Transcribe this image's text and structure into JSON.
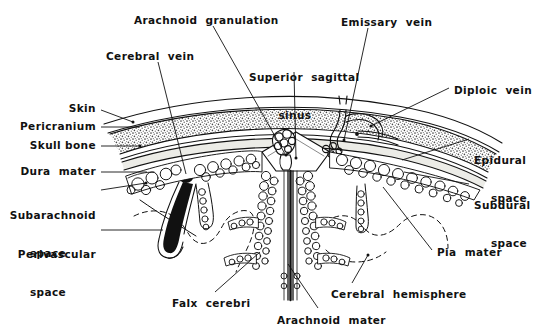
{
  "figure": {
    "width": 544,
    "height": 336,
    "background": "#ffffff",
    "ink": "#111111",
    "bone_stipple": "#6d6d6d",
    "dura_fill": "#e9e9e4"
  },
  "labels": {
    "arachnoid_granulation": "Arachnoid  granulation",
    "emissary_vein": "Emissary  vein",
    "cerebral_vein": "Cerebral  vein",
    "superior_sagittal_sinus_line1": "Superior  sagittal",
    "superior_sagittal_sinus_line2": "sinus",
    "diploic_vein": "Diploic  vein",
    "skin": "Skin",
    "pericranium": "Pericranium",
    "skull_bone": "Skull bone",
    "dura_mater": "Dura  mater",
    "subarachnoid_space_line1": "Subarachnoid",
    "subarachnoid_space_line2": "space",
    "perivascular_space_line1": "Perivascular",
    "perivascular_space_line2": "space",
    "epidural_space_line1": "Epidural",
    "epidural_space_line2": "space",
    "subdural_space_line1": "Subdural",
    "subdural_space_line2": "space",
    "pia_mater": "Pia  mater",
    "falx_cerebri": "Falx  cerebri",
    "arachnoid_mater": "Arachnoid  mater",
    "cerebral_hemisphere": "Cerebral  hemisphere"
  },
  "label_positions": {
    "arachnoid_granulation": {
      "x": 134,
      "y": 14,
      "align": "left"
    },
    "emissary_vein": {
      "x": 341,
      "y": 16,
      "align": "left"
    },
    "cerebral_vein": {
      "x": 106,
      "y": 50,
      "align": "left"
    },
    "superior_sagittal_sinus": {
      "x": 249,
      "y": 46,
      "align": "left"
    },
    "diploic_vein": {
      "x": 454,
      "y": 84,
      "align": "left"
    },
    "skin": {
      "x": 96,
      "y": 108,
      "align": "right"
    },
    "pericranium": {
      "x": 96,
      "y": 125,
      "align": "right"
    },
    "pericranium_right": {
      "x": 96,
      "y": 125,
      "align": "right"
    },
    "skull_bone": {
      "x": 96,
      "y": 144,
      "align": "right"
    },
    "dura_mater": {
      "x": 96,
      "y": 169,
      "align": "right"
    },
    "subarachnoid_space": {
      "x": 96,
      "y": 190,
      "align": "right"
    },
    "perivascular_space": {
      "x": 96,
      "y": 228,
      "align": "right"
    },
    "epidural_space": {
      "x": 474,
      "y": 135,
      "align": "left"
    },
    "subdural_space": {
      "x": 474,
      "y": 180,
      "align": "left"
    },
    "pia_mater": {
      "x": 437,
      "y": 246,
      "align": "left"
    },
    "falx_cerebri": {
      "x": 172,
      "y": 297,
      "align": "left"
    },
    "arachnoid_mater": {
      "x": 277,
      "y": 314,
      "align": "left"
    },
    "cerebral_hemisphere": {
      "x": 331,
      "y": 288,
      "align": "left"
    }
  },
  "leader_lines": [
    {
      "name": "arachnoid-granulation-leader",
      "points": "213,26 285,154"
    },
    {
      "name": "emissary-vein-leader",
      "points": "368,28 344,140"
    },
    {
      "name": "cerebral-vein-leader",
      "points": "158,62 186,174"
    },
    {
      "name": "superior-sagittal-sinus-leader",
      "points": "294,72 296,158"
    },
    {
      "name": "diploic-vein-leader",
      "points": "449,88 371,126"
    },
    {
      "name": "skin-leader",
      "points": "101,110 133,122"
    },
    {
      "name": "pericranium-leader",
      "points": "101,127 139,127"
    },
    {
      "name": "skull-bone-leader",
      "points": "101,146 140,146"
    },
    {
      "name": "dura-mater-leader",
      "points": "101,172 147,172"
    },
    {
      "name": "subarachnoid-space-leader",
      "points": "101,190 146,183"
    },
    {
      "name": "perivascular-space-leader",
      "points": "101,230 163,230"
    },
    {
      "name": "epidural-space-leader",
      "points": "469,139 402,160"
    },
    {
      "name": "subdural-space-leader",
      "points": "469,184 404,172"
    },
    {
      "name": "pia-mater-leader",
      "points": "432,250 383,187"
    },
    {
      "name": "falx-cerebri-leader",
      "points": "215,292 260,252"
    },
    {
      "name": "arachnoid-mater-leader",
      "points": "318,308 288,264"
    },
    {
      "name": "cerebral-hemisphere-leader",
      "points": "352,283 368,255"
    }
  ],
  "anatomy": {
    "layers": [
      "skin",
      "pericranium",
      "skull bone (diploe, stippled)",
      "dura mater",
      "epidural space",
      "subdural space",
      "arachnoid mater (trabecular)",
      "subarachnoid space",
      "pia mater",
      "cerebral hemisphere"
    ],
    "structures": [
      "superior sagittal sinus",
      "arachnoid granulation",
      "falx cerebri",
      "cerebral vein",
      "emissary vein",
      "diploic vein",
      "perivascular space"
    ]
  }
}
